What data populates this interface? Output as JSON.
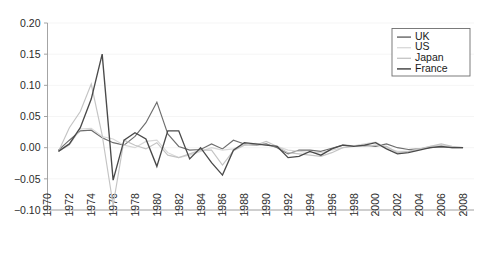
{
  "chart_data": {
    "type": "line",
    "title": "",
    "subtitle": "",
    "xlabel": "",
    "ylabel": "",
    "xlim": [
      1970,
      2009
    ],
    "ylim": [
      -0.1,
      0.2
    ],
    "grid": true,
    "legend_position": "top-right",
    "y_ticks": [
      "0.20",
      "0.15",
      "0.10",
      "0.05",
      "0.00",
      "-0.05",
      "-0.10"
    ],
    "y_tick_values": [
      0.2,
      0.15,
      0.1,
      0.05,
      0.0,
      -0.05,
      -0.1
    ],
    "x_ticks": [
      "1970",
      "1972",
      "1974",
      "1976",
      "1978",
      "1980",
      "1982",
      "1984",
      "1986",
      "1988",
      "1990",
      "1992",
      "1994",
      "1996",
      "1998",
      "2000",
      "2002",
      "2004",
      "2006",
      "2008"
    ],
    "x_tick_values": [
      1970,
      1972,
      1974,
      1976,
      1978,
      1980,
      1982,
      1984,
      1986,
      1988,
      1990,
      1992,
      1994,
      1996,
      1998,
      2000,
      2002,
      2004,
      2006,
      2008
    ],
    "x": [
      1971,
      1972,
      1973,
      1974,
      1975,
      1976,
      1977,
      1978,
      1979,
      1980,
      1981,
      1982,
      1983,
      1984,
      1985,
      1986,
      1987,
      1988,
      1989,
      1990,
      1991,
      1992,
      1993,
      1994,
      1995,
      1996,
      1997,
      1998,
      1999,
      2000,
      2001,
      2002,
      2003,
      2004,
      2005,
      2006,
      2007,
      2008
    ],
    "series": [
      {
        "name": "UK",
        "color": "#6e6e6e",
        "values": [
          -0.004,
          0.012,
          0.027,
          0.028,
          0.016,
          0.008,
          0.004,
          0.018,
          0.04,
          0.073,
          0.022,
          0.002,
          -0.004,
          -0.003,
          0.006,
          -0.002,
          0.012,
          0.006,
          0.004,
          0.006,
          0.0,
          -0.01,
          -0.004,
          -0.004,
          -0.006,
          -0.001,
          0.004,
          0.003,
          0.004,
          0.002,
          0.006,
          0.0,
          -0.003,
          -0.002,
          0.0,
          0.001,
          0.0,
          0.0
        ]
      },
      {
        "name": "US",
        "color": "#d8d8d8",
        "values": [
          -0.006,
          0.004,
          0.03,
          0.031,
          0.018,
          0.014,
          0.004,
          0.0,
          0.01,
          0.012,
          -0.008,
          -0.016,
          -0.012,
          -0.006,
          0.0,
          -0.004,
          -0.002,
          0.004,
          0.007,
          0.004,
          0.002,
          -0.004,
          -0.006,
          -0.008,
          -0.008,
          -0.004,
          0.0,
          0.003,
          0.006,
          0.009,
          0.0,
          -0.006,
          -0.006,
          -0.003,
          0.002,
          0.004,
          0.001,
          0.0
        ]
      },
      {
        "name": "Japan",
        "color": "#c4c4c4",
        "values": [
          -0.006,
          0.032,
          0.058,
          0.102,
          0.02,
          -0.092,
          0.012,
          0.004,
          -0.002,
          0.008,
          -0.012,
          -0.016,
          -0.01,
          -0.004,
          -0.004,
          -0.028,
          -0.005,
          0.004,
          0.004,
          0.01,
          0.002,
          -0.008,
          -0.01,
          -0.012,
          -0.014,
          -0.008,
          0.0,
          0.002,
          0.002,
          0.004,
          0.002,
          -0.008,
          -0.006,
          -0.002,
          0.002,
          0.006,
          0.002,
          0.0
        ]
      },
      {
        "name": "France",
        "color": "#4a4a4a",
        "values": [
          -0.006,
          0.006,
          0.032,
          0.078,
          0.15,
          -0.052,
          0.012,
          0.024,
          0.014,
          -0.03,
          0.027,
          0.027,
          -0.018,
          0.0,
          -0.024,
          -0.044,
          -0.004,
          0.008,
          0.006,
          0.004,
          0.002,
          -0.016,
          -0.014,
          -0.006,
          -0.012,
          -0.002,
          0.004,
          0.002,
          0.004,
          0.008,
          -0.002,
          -0.01,
          -0.008,
          -0.004,
          0.0,
          0.002,
          0.0,
          0.0
        ]
      }
    ]
  },
  "legend": {
    "entries": [
      {
        "label": "UK",
        "color": "#6e6e6e"
      },
      {
        "label": "US",
        "color": "#d8d8d8"
      },
      {
        "label": "Japan",
        "color": "#c4c4c4"
      },
      {
        "label": "France",
        "color": "#4a4a4a"
      }
    ]
  }
}
